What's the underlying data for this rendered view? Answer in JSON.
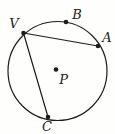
{
  "diagram": {
    "background": "#fefefd",
    "stroke_color": "#1c1c1c",
    "label_color": "#1c1c1c",
    "stroke_width": 1.2,
    "dot_radius": 2.3,
    "font_size": 13,
    "circle": {
      "cx": 57.5,
      "cy": 71,
      "r": 49.5
    },
    "center_point": {
      "label": "P",
      "x": 56,
      "y": 69.5,
      "label_x": 63.5,
      "label_y": 84
    },
    "points": [
      {
        "label": "V",
        "x": 23.5,
        "y": 33,
        "label_x": 14,
        "label_y": 28
      },
      {
        "label": "B",
        "x": 66,
        "y": 22,
        "label_x": 77,
        "label_y": 19
      },
      {
        "label": "A",
        "x": 98,
        "y": 46,
        "label_x": 107,
        "label_y": 42
      },
      {
        "label": "C",
        "x": 48,
        "y": 117,
        "label_x": 47,
        "label_y": 131
      }
    ],
    "chords": [
      {
        "from": "V",
        "to": "A"
      },
      {
        "from": "V",
        "to": "C"
      }
    ]
  }
}
